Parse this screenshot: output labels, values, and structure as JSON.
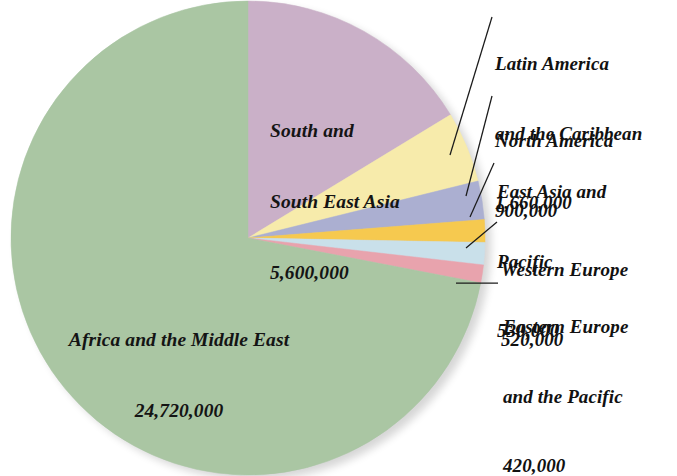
{
  "chart_data": {
    "type": "pie",
    "title": "",
    "subtitle": "",
    "xlabel": "",
    "ylabel": "",
    "legend_position": "none",
    "grid": false,
    "total": 34350000,
    "start_angle_deg": 0,
    "direction": "clockwise",
    "categories": [
      "South and\nSouth East Asia",
      "Latin America\nand the Caribbean",
      "North America",
      "East Asia and\nPacific",
      "Western Europe",
      "Eastern Europe\nand the Pacific",
      "Africa and the Middle East"
    ],
    "values": [
      5600000,
      1660000,
      900000,
      530000,
      520000,
      420000,
      24720000
    ],
    "value_labels": [
      "5,600,000",
      "1,660,000",
      "900,000",
      "530,000",
      "520,000",
      "420,000",
      "24,720,000"
    ],
    "colors": [
      "#c9aec6",
      "#f7eba8",
      "#a8add0",
      "#f6c749",
      "#c8dfea",
      "#e8a0ab",
      "#a7c4a0"
    ],
    "slices": [
      {
        "name": "south-and-south-east-asia",
        "label_line1": "South and",
        "label_line2": "South East Asia",
        "value_label": "5,600,000",
        "value": 5600000,
        "color": "#c9aec6",
        "label_placement": "inside"
      },
      {
        "name": "latin-america-and-the-caribbean",
        "label_line1": "Latin America",
        "label_line2": "and the Caribbean",
        "value_label": "1,660,000",
        "value": 1660000,
        "color": "#f7eba8",
        "label_placement": "callout"
      },
      {
        "name": "north-america",
        "label_line1": "North America",
        "label_line2": "",
        "value_label": "900,000",
        "value": 900000,
        "color": "#a8add0",
        "label_placement": "callout"
      },
      {
        "name": "east-asia-and-pacific",
        "label_line1": "East Asia and",
        "label_line2": "Pacific",
        "value_label": "530,000",
        "value": 530000,
        "color": "#f6c749",
        "label_placement": "callout"
      },
      {
        "name": "western-europe",
        "label_line1": "Western Europe",
        "label_line2": "",
        "value_label": "520,000",
        "value": 520000,
        "color": "#c8dfea",
        "label_placement": "callout"
      },
      {
        "name": "eastern-europe-and-the-pacific",
        "label_line1": "Eastern Europe",
        "label_line2": "and the Pacific",
        "value_label": "420,000",
        "value": 420000,
        "color": "#e8a0ab",
        "label_placement": "callout"
      },
      {
        "name": "africa-and-the-middle-east",
        "label_line1": "Africa and the Middle East",
        "label_line2": "",
        "value_label": "24,720,000",
        "value": 24720000,
        "color": "#a7c4a0",
        "label_placement": "inside"
      }
    ]
  },
  "labels": {
    "africa_name": "Africa and the Middle East",
    "africa_value": "24,720,000",
    "ssea_line1": "South and",
    "ssea_line2": "South East Asia",
    "ssea_value": "5,600,000",
    "latin_line1": "Latin America",
    "latin_line2": "and the Caribbean",
    "latin_value": "1,660,000",
    "north_line1": "North America",
    "north_value": "900,000",
    "eastasia_line1": "East Asia and",
    "eastasia_line2": "Pacific",
    "eastasia_value": "530,000",
    "westeurope_line1": "Western Europe",
    "westeurope_value": "520,000",
    "easteurope_line1": "Eastern Europe",
    "easteurope_line2": "and the Pacific",
    "easteurope_value": "420,000"
  }
}
